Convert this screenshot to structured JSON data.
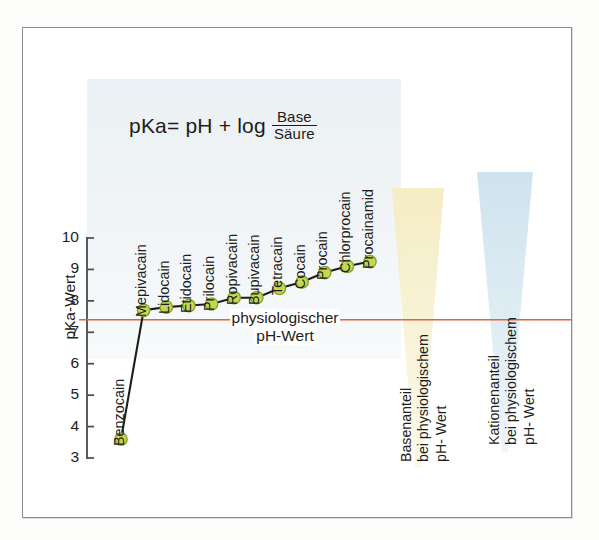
{
  "figure": {
    "formula": {
      "lhs": "pKa= pH + log",
      "numerator": "Base",
      "denominator": "Säure"
    },
    "axis": {
      "y_title": "pKa-Wert",
      "y_ticks": [
        "10",
        "9",
        "8",
        "7",
        "6",
        "5",
        "4",
        "3"
      ]
    },
    "ph_line": {
      "line1": "physiologischer",
      "line2": "pH-Wert",
      "color": "#e8603c",
      "value": 7.4
    },
    "triangles": [
      {
        "name": "base-fraction",
        "line1": "Basenanteil",
        "line2": "bei physiologischem",
        "line3": "pH- Wert",
        "color": "#f5edc4"
      },
      {
        "name": "cation-fraction",
        "line1": "Kationenanteil",
        "line2": "bei physiologischem",
        "line3": "pH- Wert",
        "color": "#cfe3ee"
      }
    ]
  },
  "chart_data": {
    "type": "line",
    "title": "",
    "xlabel": "",
    "ylabel": "pKa-Wert",
    "ylim": [
      3,
      10
    ],
    "grid": false,
    "legend": "none",
    "marker_color": "#c3d84e",
    "marker_edge_color": "#8a9a2e",
    "line_color": "#1d1d1b",
    "categories": [
      "Benzocain",
      "Mepivacain",
      "Lidocain",
      "Etidocain",
      "Prilocain",
      "Ropivacain",
      "Bupivacain",
      "Tetracain",
      "Cocain",
      "Procain",
      "Chlorprocain",
      "Procainamid"
    ],
    "values": [
      3.6,
      7.7,
      7.8,
      7.85,
      7.9,
      8.1,
      8.1,
      8.4,
      8.6,
      8.9,
      9.1,
      9.25
    ],
    "annotations": [
      {
        "text": "physiologischer pH-Wert",
        "y": 7.4
      }
    ]
  }
}
